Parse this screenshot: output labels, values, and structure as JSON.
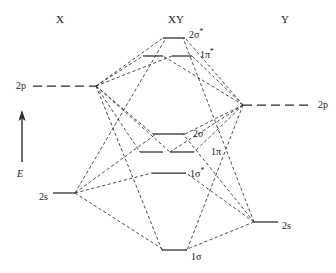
{
  "diagram": {
    "title_columns": [
      {
        "key": "left",
        "label": "X",
        "x": 60,
        "y": 13
      },
      {
        "key": "center",
        "label": "XY",
        "x": 176,
        "y": 13
      },
      {
        "key": "right",
        "label": "Y",
        "x": 285,
        "y": 13
      }
    ],
    "energy_axis": {
      "label": "E",
      "x": 17,
      "y": 168,
      "arrow_x": 22,
      "arrow_top": 110,
      "arrow_bottom": 162
    },
    "stroke_color": "#2b2b2b",
    "background_color": "#ffffff",
    "atomic_orbitals": [
      {
        "name": "2p",
        "side": "left",
        "label": "2p",
        "label_x": 26,
        "label_y": 86,
        "x1": 33,
        "x2": 96,
        "y": 86,
        "style": "dashed"
      },
      {
        "name": "2s",
        "side": "left",
        "label": "2s",
        "label_x": 48,
        "label_y": 197,
        "x1": 53,
        "x2": 75,
        "y": 193,
        "style": "solid"
      },
      {
        "name": "2p",
        "side": "right",
        "label": "2p",
        "label_x": 318,
        "label_y": 105,
        "x1": 243,
        "x2": 313,
        "y": 105,
        "style": "dashed"
      },
      {
        "name": "2s",
        "side": "right",
        "label": "2s",
        "label_x": 282,
        "label_y": 226,
        "x1": 254,
        "x2": 278,
        "y": 222,
        "style": "solid"
      }
    ],
    "molecular_orbitals": [
      {
        "name": "2sigma-star",
        "label": "2σ",
        "superscript": "*",
        "label_x": 189,
        "label_y": 34,
        "y": 38,
        "segments": [
          [
            163,
            185
          ]
        ],
        "style": "solid"
      },
      {
        "name": "1pi-star",
        "label": "1π",
        "superscript": "*",
        "label_x": 200,
        "label_y": 54,
        "y": 56,
        "segments": [
          [
            143,
            163
          ],
          [
            172,
            192
          ]
        ],
        "style": "solid"
      },
      {
        "name": "2sigma",
        "label": "2σ",
        "superscript": "",
        "label_x": 193,
        "label_y": 134,
        "y": 134,
        "segments": [
          [
            153,
            185
          ]
        ],
        "style": "solid"
      },
      {
        "name": "1pi",
        "label": "1π",
        "superscript": "",
        "label_x": 211,
        "label_y": 152,
        "y": 152,
        "segments": [
          [
            140,
            163
          ],
          [
            170,
            194
          ]
        ],
        "style": "solid"
      },
      {
        "name": "1sigma-star",
        "label": "1σ",
        "superscript": "*",
        "label_x": 190,
        "label_y": 173,
        "y": 173,
        "segments": [
          [
            152,
            186
          ]
        ],
        "style": "solid"
      },
      {
        "name": "1sigma",
        "label": "1σ",
        "superscript": "",
        "label_x": 191,
        "label_y": 257,
        "y": 250,
        "segments": [
          [
            162,
            187
          ]
        ],
        "style": "solid"
      }
    ],
    "correlation_nodes": {
      "left_2p": [
        96,
        86
      ],
      "left_2s": [
        75,
        193
      ],
      "right_2p": [
        243,
        105
      ],
      "right_2s": [
        254,
        222
      ]
    },
    "correlation_lines": [
      {
        "from": "left_2p",
        "to_mo": "2sigma-star",
        "to_x": 163,
        "to_y": 38
      },
      {
        "from": "left_2p",
        "to_mo": "1pi-star",
        "to_x": 143,
        "to_y": 56
      },
      {
        "from": "left_2p",
        "to_mo": "1pi-star",
        "to_x": 172,
        "to_y": 56
      },
      {
        "from": "left_2p",
        "to_mo": "2sigma",
        "to_x": 153,
        "to_y": 134
      },
      {
        "from": "left_2p",
        "to_mo": "1pi",
        "to_x": 140,
        "to_y": 152
      },
      {
        "from": "left_2p",
        "to_mo": "1pi",
        "to_x": 170,
        "to_y": 152
      },
      {
        "from": "left_2p",
        "to_mo": "1sigma",
        "to_x": 162,
        "to_y": 250
      },
      {
        "from": "left_2s",
        "to_mo": "2sigma-star",
        "to_x": 166,
        "to_y": 38
      },
      {
        "from": "left_2s",
        "to_mo": "2sigma",
        "to_x": 156,
        "to_y": 134
      },
      {
        "from": "left_2s",
        "to_mo": "1sigma-star",
        "to_x": 152,
        "to_y": 173
      },
      {
        "from": "left_2s",
        "to_mo": "1sigma",
        "to_x": 164,
        "to_y": 250
      },
      {
        "from": "right_2p",
        "to_mo": "2sigma-star",
        "to_x": 185,
        "to_y": 38
      },
      {
        "from": "right_2p",
        "to_mo": "1pi-star",
        "to_x": 192,
        "to_y": 56
      },
      {
        "from": "right_2p",
        "to_mo": "1pi-star",
        "to_x": 163,
        "to_y": 56
      },
      {
        "from": "right_2p",
        "to_mo": "2sigma",
        "to_x": 185,
        "to_y": 134
      },
      {
        "from": "right_2p",
        "to_mo": "1pi",
        "to_x": 194,
        "to_y": 152
      },
      {
        "from": "right_2p",
        "to_mo": "1pi",
        "to_x": 170,
        "to_y": 152
      },
      {
        "from": "right_2p",
        "to_mo": "1sigma",
        "to_x": 187,
        "to_y": 250
      },
      {
        "from": "right_2s",
        "to_mo": "2sigma-star",
        "to_x": 183,
        "to_y": 38
      },
      {
        "from": "right_2s",
        "to_mo": "2sigma",
        "to_x": 183,
        "to_y": 134
      },
      {
        "from": "right_2s",
        "to_mo": "1sigma-star",
        "to_x": 186,
        "to_y": 173
      },
      {
        "from": "right_2s",
        "to_mo": "1sigma",
        "to_x": 185,
        "to_y": 250
      }
    ]
  }
}
